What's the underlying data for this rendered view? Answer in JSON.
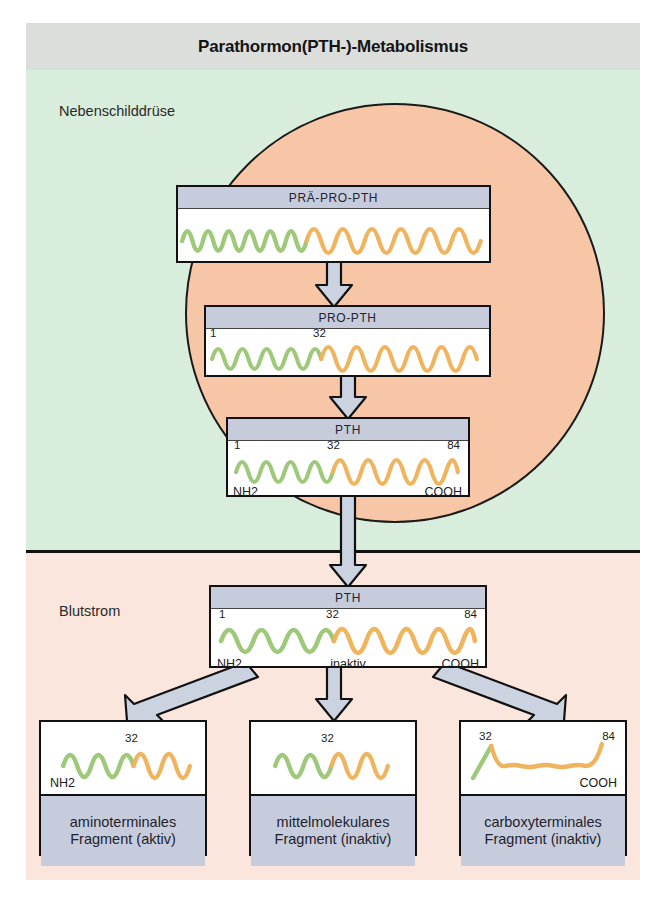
{
  "title": "Parathormon(PTH-)-Metabolismus",
  "regions": {
    "gland": "Nebenschilddrüse",
    "blood": "Blutstrom"
  },
  "colors": {
    "title_band": "#dcdedc",
    "gland_band": "#d9eddc",
    "blood_band": "#fae6dd",
    "gland_circle": "#f6c6a6",
    "box_header": "#c7ccdd",
    "arrow_fill": "#ccd3e0",
    "wave_green": "#9ec87a",
    "wave_orange": "#f0b45e",
    "outline": "#111111"
  },
  "boxes": [
    {
      "id": "prepro",
      "label": "PRÄ-PRO-PTH",
      "label_position": "top",
      "ticks": [],
      "terminals": [],
      "note": "",
      "green_fraction": 0.42
    },
    {
      "id": "pro",
      "label": "PRO-PTH",
      "label_position": "top",
      "ticks": [
        "1",
        "32"
      ],
      "terminals": [],
      "note": "",
      "green_fraction": 0.42
    },
    {
      "id": "pth_gland",
      "label": "PTH",
      "label_position": "top",
      "ticks": [
        "1",
        "32",
        "84"
      ],
      "terminals": [
        "NH2",
        "COOH"
      ],
      "note": "",
      "green_fraction": 0.45
    },
    {
      "id": "pth_blood",
      "label": "PTH",
      "label_position": "top",
      "ticks": [
        "1",
        "32",
        "84"
      ],
      "terminals": [
        "NH2",
        "COOH"
      ],
      "note": "inaktiv",
      "green_fraction": 0.45
    }
  ],
  "fragments": [
    {
      "id": "aminoterminal",
      "caption_line1": "aminoterminales",
      "caption_line2": "Fragment (aktiv)",
      "ticks": [
        "32"
      ],
      "terminals": [
        "NH2"
      ],
      "green_fraction": 0.58
    },
    {
      "id": "midmolecule",
      "caption_line1": "mittelmolekulares",
      "caption_line2": "Fragment (inaktiv)",
      "ticks": [
        "32"
      ],
      "terminals": [],
      "green_fraction": 0.52
    },
    {
      "id": "carboxyterminal",
      "caption_line1": "carboxyterminales",
      "caption_line2": "Fragment (inaktiv)",
      "ticks": [
        "32",
        "84"
      ],
      "terminals": [
        "COOH"
      ],
      "green_fraction": 0.12
    }
  ],
  "arrows": [
    {
      "id": "prepro-to-pro",
      "direction": "down"
    },
    {
      "id": "pro-to-pth",
      "direction": "down"
    },
    {
      "id": "pth-to-blood",
      "direction": "down"
    },
    {
      "id": "blood-to-aminoterminal",
      "direction": "down-left"
    },
    {
      "id": "blood-to-midmolecule",
      "direction": "down"
    },
    {
      "id": "blood-to-carboxyterminal",
      "direction": "down-right"
    }
  ]
}
